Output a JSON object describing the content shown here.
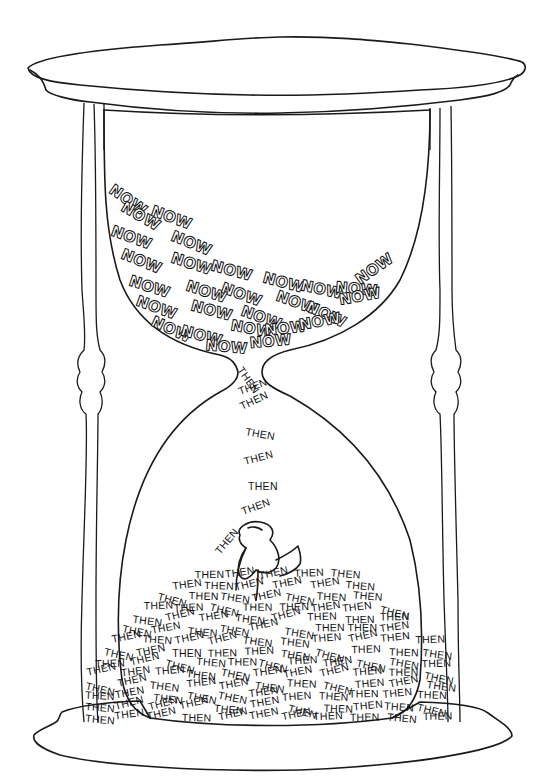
{
  "illustration": {
    "subject": "hourglass",
    "top_words": {
      "word": "NOW",
      "rows": [
        {
          "x": 108,
          "y": 192,
          "rot": 35
        },
        {
          "x": 120,
          "y": 210,
          "rot": 30
        },
        {
          "x": 150,
          "y": 215,
          "rot": 20
        },
        {
          "x": 110,
          "y": 235,
          "rot": 20
        },
        {
          "x": 170,
          "y": 240,
          "rot": 22
        },
        {
          "x": 120,
          "y": 258,
          "rot": 22
        },
        {
          "x": 170,
          "y": 262,
          "rot": 18
        },
        {
          "x": 210,
          "y": 270,
          "rot": 15
        },
        {
          "x": 128,
          "y": 285,
          "rot": 18
        },
        {
          "x": 185,
          "y": 290,
          "rot": 18
        },
        {
          "x": 220,
          "y": 292,
          "rot": 20
        },
        {
          "x": 262,
          "y": 282,
          "rot": 15
        },
        {
          "x": 300,
          "y": 290,
          "rot": 12
        },
        {
          "x": 335,
          "y": 292,
          "rot": 5
        },
        {
          "x": 360,
          "y": 285,
          "rot": -35
        },
        {
          "x": 135,
          "y": 305,
          "rot": 20
        },
        {
          "x": 190,
          "y": 310,
          "rot": 15
        },
        {
          "x": 240,
          "y": 315,
          "rot": 20
        },
        {
          "x": 275,
          "y": 300,
          "rot": 20
        },
        {
          "x": 305,
          "y": 310,
          "rot": 25
        },
        {
          "x": 340,
          "y": 305,
          "rot": -10
        },
        {
          "x": 150,
          "y": 325,
          "rot": 25
        },
        {
          "x": 180,
          "y": 335,
          "rot": 15
        },
        {
          "x": 230,
          "y": 330,
          "rot": 10
        },
        {
          "x": 265,
          "y": 335,
          "rot": -5
        },
        {
          "x": 300,
          "y": 330,
          "rot": -10
        },
        {
          "x": 205,
          "y": 350,
          "rot": 5
        },
        {
          "x": 250,
          "y": 348,
          "rot": -5
        }
      ]
    },
    "stream_words": {
      "word": "THEN",
      "items": [
        {
          "x": 237,
          "y": 370,
          "rot": 55
        },
        {
          "x": 240,
          "y": 395,
          "rot": -20
        },
        {
          "x": 242,
          "y": 410,
          "rot": -25
        },
        {
          "x": 245,
          "y": 435,
          "rot": 10
        },
        {
          "x": 245,
          "y": 465,
          "rot": -15
        },
        {
          "x": 248,
          "y": 490,
          "rot": 0
        },
        {
          "x": 243,
          "y": 515,
          "rot": -20
        },
        {
          "x": 220,
          "y": 555,
          "rot": -50
        }
      ]
    },
    "pile_word": "THEN",
    "pile_count": 110
  }
}
